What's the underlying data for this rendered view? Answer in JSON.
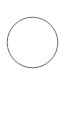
{
  "canvas": {
    "width": 66,
    "height": 114,
    "background_color": "#ffffff",
    "has_border": false
  },
  "shapes": [
    {
      "name": "circle-outline",
      "type": "circle",
      "center_x": 32.5,
      "center_y": 42.5,
      "radius": 25.3,
      "diameter": 50.6,
      "stroke_color": "#6b6b70",
      "stroke_width": 1,
      "fill": "none",
      "label": ""
    }
  ],
  "regions": {
    "top_blank_label": "",
    "bottom_blank_label": ""
  },
  "text": {
    "caption": "",
    "annotation": ""
  }
}
